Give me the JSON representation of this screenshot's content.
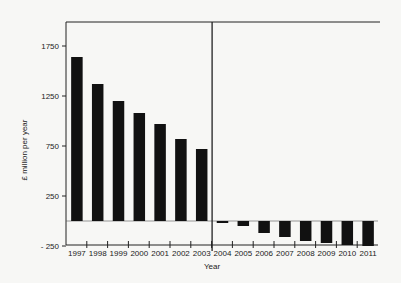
{
  "chart_data": {
    "type": "bar",
    "title": "",
    "xlabel": "Year",
    "ylabel": "£ million per year",
    "ylim": [
      -250,
      1750
    ],
    "yticks": [
      -250,
      250,
      750,
      1250,
      1750
    ],
    "grid": false,
    "legend": null,
    "divider_between": [
      "2003",
      "2004"
    ],
    "categories": [
      "1997",
      "1998",
      "1999",
      "2000",
      "2001",
      "2002",
      "2003",
      "2004",
      "2005",
      "2006",
      "2007",
      "2008",
      "2009",
      "2010",
      "2011"
    ],
    "values": [
      1640,
      1370,
      1200,
      1080,
      970,
      820,
      720,
      -20,
      -50,
      -120,
      -160,
      -200,
      -220,
      -240,
      -250
    ],
    "bar_color": "#111111"
  },
  "axis": {
    "ylabel": "£ million per year",
    "xlabel": "Year",
    "yticks": [
      "1750",
      "1250",
      "750",
      "250",
      "- 250"
    ]
  }
}
